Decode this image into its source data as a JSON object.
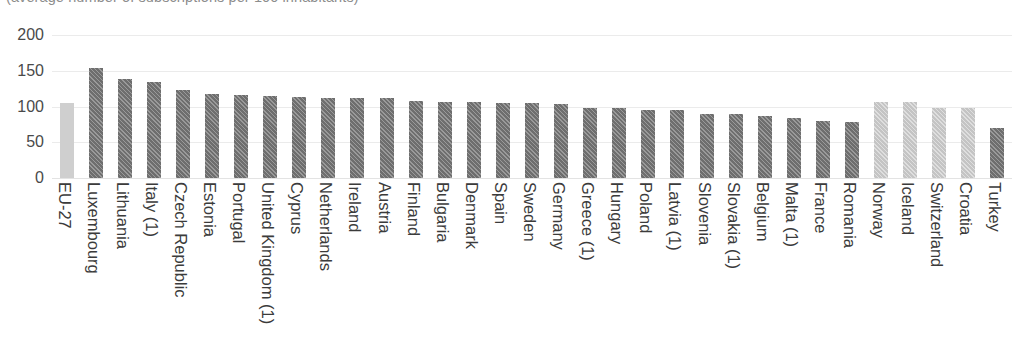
{
  "chart_data": {
    "type": "bar",
    "title": "(average number of subscriptions per 100 inhabitants)",
    "xlabel": "",
    "ylabel": "",
    "ylim": [
      0,
      200
    ],
    "yticks": [
      0,
      50,
      100,
      150,
      200
    ],
    "grid": true,
    "legend": "none",
    "categories": [
      "EU-27",
      "Luxembourg",
      "Lithuania",
      "Italy (1)",
      "Czech Republic",
      "Estonia",
      "Portugal",
      "United Kingdom (1)",
      "Cyprus",
      "Netherlands",
      "Ireland",
      "Austria",
      "Finland",
      "Bulgaria",
      "Denmark",
      "Spain",
      "Sweden",
      "Germany",
      "Greece (1)",
      "Hungary",
      "Poland",
      "Latvia (1)",
      "Slovenia",
      "Slovakia (1)",
      "Belgium",
      "Malta (1)",
      "France",
      "Romania",
      "Norway",
      "Iceland",
      "Switzerland",
      "Croatia",
      "Turkey"
    ],
    "values": [
      105,
      154,
      139,
      134,
      123,
      117,
      116,
      115,
      113,
      112,
      112,
      112,
      108,
      107,
      106,
      105,
      105,
      103,
      98,
      98,
      95,
      95,
      90,
      90,
      87,
      84,
      80,
      79,
      107,
      107,
      98,
      98,
      70
    ],
    "bar_styles": [
      "light-solid",
      "dark",
      "dark",
      "dark",
      "dark",
      "dark",
      "dark",
      "dark",
      "dark",
      "dark",
      "dark",
      "dark",
      "dark",
      "dark",
      "dark",
      "dark",
      "dark",
      "dark",
      "dark",
      "dark",
      "dark",
      "dark",
      "dark",
      "dark",
      "dark",
      "dark",
      "dark",
      "dark",
      "light-hatch",
      "light-hatch",
      "light-hatch",
      "light-hatch",
      "dark"
    ],
    "colors": {
      "bar_dark": "#6e6e6e",
      "bar_light_solid": "#cfcfcf",
      "bar_light_hatch": "#c4c4c4",
      "gridline": "#ebebeb",
      "axis_text": "#4a4a4a",
      "title_text": "#8d8d8d",
      "background": "#ffffff"
    }
  }
}
